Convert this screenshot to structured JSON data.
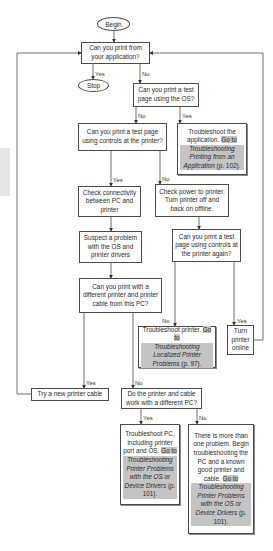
{
  "nodes": {
    "begin": "Begin",
    "stop": "Stop",
    "q_app": "Can you print from your application?",
    "q_os": "Can you print a test page using the OS?",
    "ts_app_plain": "Troubleshoot the application.",
    "ts_app_goto": "Go to",
    "ts_app_ref": "Troubleshooting Printing from an Application",
    "ts_app_page": "(p. 102).",
    "q_controls": "Can you print a test page using controls at the printer?",
    "check_conn": "Check connectivity between PC and printer",
    "check_power": "Check power to printer. Turn printer off and back on offline.",
    "suspect": "Suspect a problem with the OS and printer drivers",
    "q_again": "Can you print a test page using controls at the printer again?",
    "q_diff_printer": "Can you print with a different printer and printer cable from this PC?",
    "ts_printer_plain": "Troubleshoot printer.",
    "ts_printer_goto": "Go to",
    "ts_printer_ref": "Troubleshooting Localized Printer Problems",
    "ts_printer_page": "(p. 97).",
    "turn_online": "Turn printer online",
    "try_cable": "Try a new printer cable",
    "q_diff_pc": "Do the printer and cable work with a different PC?",
    "ts_pc_plain": "Troubleshoot PC, including printer port and OS.",
    "ts_pc_goto": "Go to",
    "ts_pc_ref": "Troubleshooting Printer Problems with the OS or Device Drivers",
    "ts_pc_page": "(p. 101).",
    "multi_plain": "There is more than one problem. Begin troubleshooting the PC and a known good printer and cable.",
    "multi_goto": "Go to",
    "multi_ref": "Troubleshooting Printer Problems with the OS or Device Drivers",
    "multi_page": "(p. 101)."
  },
  "labels": {
    "yes": "Yes",
    "no": "No"
  },
  "colors": {
    "line": "#4a4a4a",
    "highlight": "#c4c4c4"
  }
}
